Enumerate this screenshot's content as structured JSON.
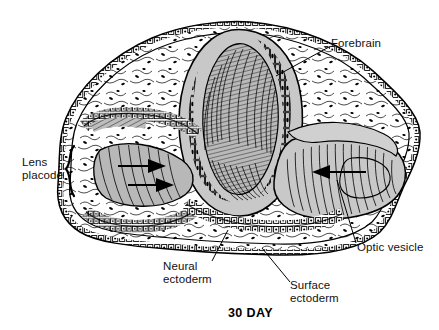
{
  "figure": {
    "caption": "30 DAY",
    "width": 439,
    "height": 330
  },
  "labels": {
    "forebrain": "Forebrain",
    "lens_placode_line1": "Lens",
    "lens_placode_line2": "placode",
    "optic_vesicle": "Optic vesicle",
    "neural_ectoderm_line1": "Neural",
    "neural_ectoderm_line2": "ectoderm",
    "surface_ectoderm_line1": "Surface",
    "surface_ectoderm_line2": "ectoderm"
  },
  "colors": {
    "background": "#ffffff",
    "ink": "#000000",
    "tissue_gray": "#c8c8c8",
    "lumen_gray": "#a8a8a8",
    "mesenchyme": "#ffffff",
    "label_text": "#111111"
  },
  "annotations": {
    "brace": "lens-placode-brace",
    "arrows": [
      "lens-invagination-arrow-right",
      "optic-vesicle-arrow-left"
    ]
  }
}
